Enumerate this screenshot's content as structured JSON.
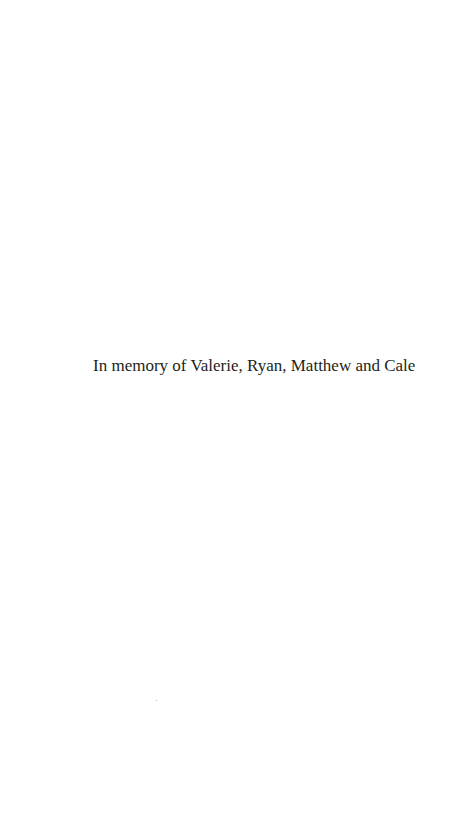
{
  "page": {
    "dedication": "In memory of Valerie, Ryan, Matthew and Cale"
  },
  "colors": {
    "background": "#ffffff",
    "text": "#231f20"
  }
}
